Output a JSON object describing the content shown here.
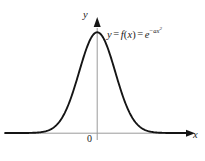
{
  "figure": {
    "name": "gaussian-function-graph",
    "background_color": "#ffffff",
    "curve_color": "#151515",
    "axis_color": "#9a9a9a",
    "arrow_color": "#151515",
    "text_color": "#1a1a1a"
  },
  "labels": {
    "y_axis": "y",
    "x_axis": "x",
    "origin": "0",
    "equation": {
      "lhs": "y",
      "equals_1": "=",
      "function": "f",
      "open_paren": "(",
      "argument": "x",
      "close_paren": ")",
      "equals_2": "=",
      "base": "e",
      "exponent_minus": "−",
      "exponent_coefficient": "a",
      "exponent_variable": "x",
      "exponent_power": "2",
      "full_text": "y = f(x) = e^(−ax²)"
    }
  },
  "chart_data": {
    "type": "line",
    "title": "",
    "xlabel": "x",
    "ylabel": "y",
    "function": "y = f(x) = e^(-a x^2)",
    "curve_name": "gaussian-bell-curve",
    "grid": false,
    "legend": false,
    "axis_arrows": [
      "x-positive",
      "y-positive"
    ],
    "origin_tick_label": "0",
    "xlim": [
      -3.6,
      3.6
    ],
    "ylim": [
      0,
      1.12
    ],
    "peak": {
      "x": 0,
      "y": 1
    },
    "x": [
      -3.6,
      -3.3,
      -3.0,
      -2.7,
      -2.4,
      -2.1,
      -1.8,
      -1.5,
      -1.2,
      -0.9,
      -0.6,
      -0.3,
      0.0,
      0.3,
      0.6,
      0.9,
      1.2,
      1.5,
      1.8,
      2.1,
      2.4,
      2.7,
      3.0,
      3.3,
      3.6
    ],
    "y": [
      0.0,
      0.0,
      0.0001,
      0.0007,
      0.0032,
      0.0122,
      0.0392,
      0.1054,
      0.2369,
      0.4449,
      0.6977,
      0.9139,
      1.0,
      0.9139,
      0.6977,
      0.4449,
      0.2369,
      0.1054,
      0.0392,
      0.0122,
      0.0032,
      0.0007,
      0.0001,
      0.0,
      0.0
    ]
  }
}
